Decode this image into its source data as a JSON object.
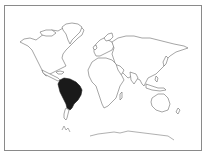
{
  "map": {
    "type": "world-outline",
    "highlighted_region": "South America",
    "colors": {
      "background": "#ffffff",
      "outline": "#6a6a6a",
      "highlight": "#1a1a1a",
      "frame": "#8a8a8a"
    }
  }
}
